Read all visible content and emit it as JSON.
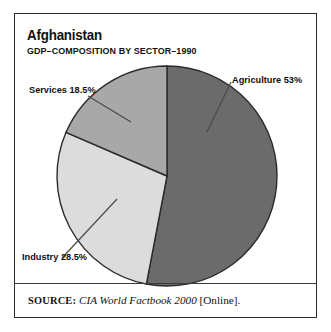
{
  "figure": {
    "title": "Afghanistan",
    "subtitle": "GDP–COMPOSITION BY SECTOR–1990"
  },
  "source": {
    "kicker": "SOURCE:",
    "work": "CIA World Factbook 2000",
    "tail": "[Online]."
  },
  "labels": {
    "agriculture": "Agriculture 53%",
    "services": "Services 18.5%",
    "industry": "Industry 28.5%"
  },
  "colors": {
    "agriculture": "#6b6b6b",
    "services": "#a8a8a8",
    "industry": "#dcdcdc",
    "outline": "#2b2b2b",
    "text": "#111111",
    "background": "#ffffff"
  },
  "chart_data": {
    "type": "pie",
    "title": "Afghanistan",
    "subtitle": "GDP–COMPOSITION BY SECTOR–1990",
    "categories": [
      "Agriculture",
      "Industry",
      "Services"
    ],
    "values": [
      53,
      28.5,
      18.5
    ],
    "unit": "percent",
    "value_labels": [
      "53%",
      "28.5%",
      "18.5%"
    ],
    "slice_colors": [
      "#6b6b6b",
      "#dcdcdc",
      "#a8a8a8"
    ],
    "start_angle_deg": 0,
    "direction": "clockwise",
    "legend": "none",
    "labels_position": "outside-with-leader-lines",
    "grid": false,
    "center_px": [
      167,
      176
    ],
    "radius_px": 110,
    "annotations": [
      "SOURCE: CIA World Factbook 2000 [Online]."
    ]
  }
}
